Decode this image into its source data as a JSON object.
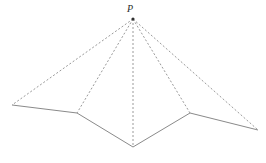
{
  "figure": {
    "type": "geometry-diagram",
    "canvas": {
      "width": 266,
      "height": 163,
      "background": "#ffffff"
    },
    "style": {
      "solid_stroke_color": "#8a8a8a",
      "solid_stroke_width": 1,
      "dashed_stroke_color": "#9a9a9a",
      "dashed_stroke_width": 1,
      "dash_pattern": "2 2",
      "point_fill": "#303030",
      "label_color": "#2b2b2b"
    },
    "apex": {
      "name": "P",
      "label": "P",
      "label_x": 130,
      "label_y": 12,
      "x": 133,
      "y": 19,
      "dot_radius": 1.6
    },
    "base_vertices": [
      {
        "name": "V1",
        "label": "",
        "x": 12,
        "y": 105
      },
      {
        "name": "V2",
        "label": "",
        "x": 77,
        "y": 113
      },
      {
        "name": "V3",
        "label": "",
        "x": 133,
        "y": 147
      },
      {
        "name": "V4",
        "label": "",
        "x": 190,
        "y": 113
      },
      {
        "name": "V5",
        "label": "",
        "x": 258,
        "y": 130
      }
    ],
    "solid_path": "M 12 105 L 77 113 L 133 147 L 190 113 L 258 130",
    "dashed_edges": [
      {
        "name": "P-V1",
        "d": "M 133 19 L 12 105"
      },
      {
        "name": "P-V2",
        "d": "M 133 19 L 77 113"
      },
      {
        "name": "P-V3",
        "d": "M 133 19 L 133 147"
      },
      {
        "name": "P-V4",
        "d": "M 133 19 L 190 113"
      },
      {
        "name": "P-V5",
        "d": "M 133 19 L 258 130"
      }
    ]
  }
}
